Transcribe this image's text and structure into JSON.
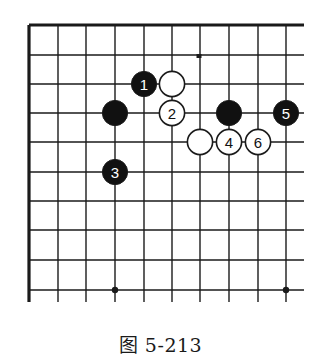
{
  "figure": {
    "caption": "图 5-213",
    "type": "go-board-diagram",
    "board_corner": "top-left",
    "colors": {
      "line": "#1a1a1a",
      "black_stone": "#111111",
      "white_stone": "#ffffff",
      "background": "#ffffff"
    }
  },
  "grid": {
    "columns_x": [
      29,
      58,
      86,
      115,
      144,
      172,
      200,
      229,
      258,
      286
    ],
    "rows_y": [
      25,
      55,
      84,
      113,
      142,
      172,
      201,
      230,
      260,
      290
    ],
    "right_extent": 304,
    "bottom_extent": 302
  },
  "star_points": [
    {
      "col": 3,
      "row": 9
    },
    {
      "col": 9,
      "row": 9
    }
  ],
  "marks": [
    {
      "x": 199,
      "y": 56,
      "kind": "small-dot"
    }
  ],
  "stones": [
    {
      "color": "black",
      "col": 4,
      "row": 2,
      "label": "1"
    },
    {
      "color": "white",
      "col": 5,
      "row": 2,
      "label": ""
    },
    {
      "color": "black",
      "col": 3,
      "row": 3,
      "label": ""
    },
    {
      "color": "white",
      "col": 5,
      "row": 3,
      "label": "2"
    },
    {
      "color": "black",
      "col": 7,
      "row": 3,
      "label": ""
    },
    {
      "color": "black",
      "col": 9,
      "row": 3,
      "label": "5"
    },
    {
      "color": "white",
      "col": 6,
      "row": 4,
      "label": ""
    },
    {
      "color": "white",
      "col": 7,
      "row": 4,
      "label": "4"
    },
    {
      "color": "white",
      "col": 8,
      "row": 4,
      "label": "6"
    },
    {
      "color": "black",
      "col": 3,
      "row": 5,
      "label": "3"
    }
  ]
}
